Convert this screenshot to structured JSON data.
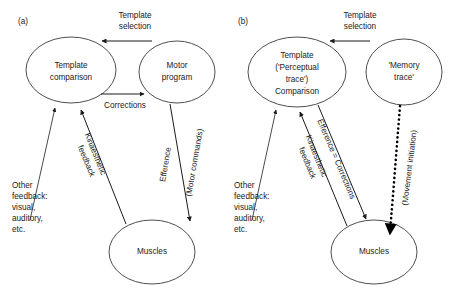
{
  "figure": {
    "width": 455,
    "height": 295,
    "background": "#ffffff",
    "stroke_color": "#1a1a1a",
    "ellipse_stroke": "#3a3a3a"
  },
  "panels": [
    {
      "id": "a",
      "label": "(a)",
      "nodes": {
        "template_comparison": {
          "line1": "Template",
          "line2": "comparison"
        },
        "motor_program": {
          "line1": "Motor",
          "line2": "program"
        },
        "muscles": {
          "line1": "Muscles"
        }
      },
      "edges": {
        "template_selection": {
          "line1": "Template",
          "line2": "selection"
        },
        "corrections": {
          "line1": "Corrections"
        },
        "efference": {
          "line1": "Efference"
        },
        "motor_commands": {
          "line1": "(Motor commands)"
        },
        "kinaesthetic": {
          "line1": "Kinaesthetic",
          "line2": "feedback"
        },
        "other_feedback": {
          "line1": "Other",
          "line2": "feedback:",
          "line3": "visual,",
          "line4": "auditory,",
          "line5": "etc."
        }
      }
    },
    {
      "id": "b",
      "label": "(b)",
      "nodes": {
        "template_comparison": {
          "line1": "Template",
          "line2": "('Perceptual",
          "line3": "trace')",
          "line4": "Comparison"
        },
        "memory_trace": {
          "line1": "'Memory",
          "line2": "trace'"
        },
        "muscles": {
          "line1": "Muscles"
        }
      },
      "edges": {
        "template_selection": {
          "line1": "Template",
          "line2": "selection"
        },
        "efference_corrections": {
          "line1": "Efference = Corrections"
        },
        "movement_initiation": {
          "line1": "(Movement initiation)"
        },
        "kinaesthetic": {
          "line1": "Kinaesthetic",
          "line2": "feedback"
        },
        "other_feedback": {
          "line1": "Other",
          "line2": "feedback:",
          "line3": "visual,",
          "line4": "auditory,",
          "line5": "etc."
        }
      }
    }
  ]
}
